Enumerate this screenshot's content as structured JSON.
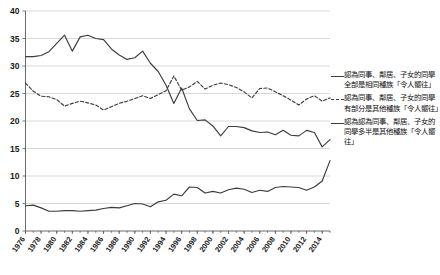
{
  "chart_data": {
    "type": "line",
    "title": "",
    "xlabel": "",
    "ylabel": "",
    "ylim": [
      0,
      40
    ],
    "yticks": [
      0,
      5,
      10,
      15,
      20,
      25,
      30,
      35,
      40
    ],
    "grid": true,
    "legend_position": "right",
    "x": [
      1976,
      1977,
      1978,
      1979,
      1980,
      1981,
      1982,
      1983,
      1984,
      1985,
      1986,
      1987,
      1988,
      1989,
      1990,
      1991,
      1992,
      1993,
      1994,
      1995,
      1996,
      1997,
      1998,
      1999,
      2000,
      2001,
      2002,
      2003,
      2004,
      2005,
      2006,
      2007,
      2008,
      2009,
      2010,
      2011,
      2012,
      2013,
      2014,
      2015
    ],
    "xtick_labels": [
      "1976",
      "1978",
      "1980",
      "1982",
      "1984",
      "1986",
      "1988",
      "1990",
      "1992",
      "1994",
      "1996",
      "1998",
      "2000",
      "2002",
      "2004",
      "2006",
      "2008",
      "2010",
      "2012",
      "2014"
    ],
    "series": [
      {
        "name": "認為同事、鄰居、子女的同學全部是相同種族「令人嚮往」",
        "style": "solid",
        "values": [
          31.7,
          31.7,
          31.9,
          32.6,
          34.1,
          35.6,
          32.7,
          35.3,
          35.6,
          35.0,
          34.8,
          33.1,
          32.0,
          31.2,
          31.5,
          32.7,
          30.5,
          29.0,
          26.5,
          23.2,
          26.0,
          22.2,
          20.1,
          20.2,
          19.1,
          17.3,
          19.0,
          19.0,
          18.8,
          18.2,
          17.9,
          18.0,
          17.5,
          18.3,
          17.4,
          17.3,
          18.3,
          17.9,
          15.3,
          16.6
        ]
      },
      {
        "name": "認為同事、鄰居、子女的同學有部分是其他種族「令人嚮往」",
        "style": "dashed",
        "values": [
          26.9,
          25.4,
          24.5,
          24.4,
          23.9,
          22.7,
          23.2,
          23.6,
          23.3,
          22.9,
          22.0,
          22.6,
          23.2,
          23.6,
          24.1,
          24.6,
          24.1,
          24.8,
          25.5,
          28.2,
          25.6,
          26.2,
          27.2,
          25.8,
          26.5,
          26.9,
          26.6,
          26.1,
          25.3,
          24.2,
          25.9,
          26.0,
          25.3,
          24.6,
          23.8,
          22.9,
          24.0,
          24.6,
          23.6,
          24.2
        ]
      },
      {
        "name": "認為認為同事、鄰居、子女的同學多半是其他種族「令人嚮往」",
        "style": "solid",
        "values": [
          4.6,
          4.7,
          4.2,
          3.6,
          3.6,
          3.7,
          3.7,
          3.6,
          3.7,
          3.8,
          4.1,
          4.3,
          4.2,
          4.6,
          5.0,
          4.9,
          4.4,
          5.3,
          5.6,
          6.7,
          6.4,
          8.0,
          7.9,
          6.9,
          7.2,
          6.9,
          7.5,
          7.8,
          7.6,
          7.0,
          7.4,
          7.2,
          7.9,
          8.1,
          8.0,
          7.9,
          7.4,
          8.0,
          9.1,
          12.8
        ]
      }
    ]
  },
  "legend": {
    "entries": [
      {
        "style": "solid",
        "label": "認為同事、鄰居、子女的同學全部是相同種族「令人嚮往」"
      },
      {
        "style": "dashed",
        "label": "認為同事、鄰居、子女的同學有部分是其他種族「令人嚮往」"
      },
      {
        "style": "solid",
        "label": "認為認為同事、鄰居、子女的同學多半是其他種族「令人嚮往」"
      }
    ]
  },
  "colors": {
    "line": "#3d3d3d",
    "grid": "#c8c8c8",
    "axis": "#5a5a5a",
    "text": "#111111",
    "background": "#ffffff"
  }
}
